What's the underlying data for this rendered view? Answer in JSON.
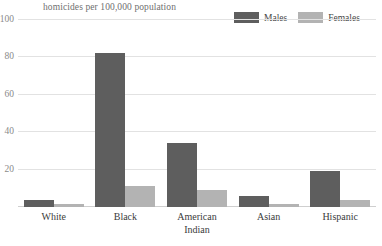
{
  "chart_data": {
    "type": "bar",
    "title": "",
    "subtitle": "homicides per 100,000 population",
    "xlabel": "",
    "ylabel": "",
    "ylim": [
      0,
      100
    ],
    "yticks": [
      0,
      20,
      40,
      60,
      80,
      100
    ],
    "ytick_labels": [
      "0",
      "20",
      "40",
      "60",
      "80",
      "100"
    ],
    "grid": true,
    "legend_position": "top-right",
    "categories": [
      "White",
      "Black",
      "American Indian",
      "Asian",
      "Hispanic"
    ],
    "category_lines": [
      [
        "White"
      ],
      [
        "Black"
      ],
      [
        "American",
        "Indian"
      ],
      [
        "Asian"
      ],
      [
        "Hispanic"
      ]
    ],
    "series": [
      {
        "name": "Males",
        "color": "#5e5e5e",
        "values": [
          4.0,
          82.5,
          34.5,
          6.0,
          19.0
        ]
      },
      {
        "name": "Females",
        "color": "#b3b3b3",
        "values": [
          1.5,
          11.0,
          9.0,
          1.5,
          3.5
        ]
      }
    ]
  },
  "colors": {
    "males": "#5e5e5e",
    "females": "#b3b3b3",
    "gridline": "#e2e2e2",
    "axis_text": "#8a8a8a",
    "subtitle_text": "#6f6f6f",
    "category_text": "#3b3b3b",
    "background": "#ffffff"
  }
}
